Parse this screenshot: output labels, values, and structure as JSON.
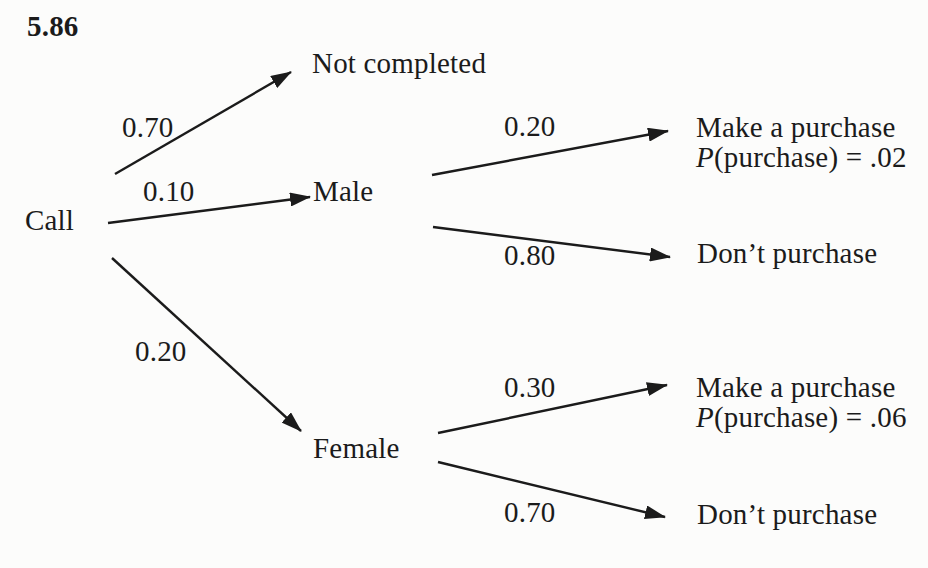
{
  "problem_number": "5.86",
  "colors": {
    "ink": "#1b1b1b",
    "paper": "#fcfcfb"
  },
  "tree": {
    "root_label": "Call",
    "nodes": {
      "not_completed": "Not completed",
      "male": "Male",
      "female": "Female"
    },
    "branches": [
      {
        "from": "Call",
        "probability": "0.70",
        "to": "Not completed"
      },
      {
        "from": "Call",
        "probability": "0.10",
        "to": "Male"
      },
      {
        "from": "Call",
        "probability": "0.20",
        "to": "Female"
      },
      {
        "from": "Male",
        "probability": "0.20",
        "to": "Make a purchase",
        "note_prefix": "P",
        "note_rest": "(purchase) = .02"
      },
      {
        "from": "Male",
        "probability": "0.80",
        "to": "Don’t purchase"
      },
      {
        "from": "Female",
        "probability": "0.30",
        "to": "Make a purchase",
        "note_prefix": "P",
        "note_rest": "(purchase) = .06"
      },
      {
        "from": "Female",
        "probability": "0.70",
        "to": "Don’t purchase"
      }
    ]
  }
}
